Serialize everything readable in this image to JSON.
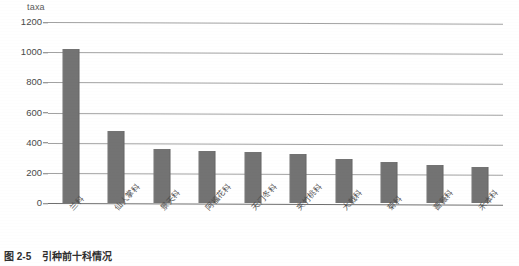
{
  "figure": {
    "caption_number": "图 2-5",
    "caption_text": "引种前十科情况"
  },
  "chart_data": {
    "type": "bar",
    "title": "引种前十科情况",
    "xlabel": "",
    "ylabel": "taxa",
    "ylim": [
      0,
      1200
    ],
    "yticks": [
      0,
      200,
      400,
      600,
      800,
      1000,
      1200
    ],
    "grid": true,
    "legend": "none",
    "bar_color": "#737373",
    "categories": [
      "兰科",
      "仙人掌科",
      "景天科",
      "阿福花科",
      "天门冬科",
      "夹竹桃科",
      "大戟科",
      "菊科",
      "蔷薇科",
      "禾本科"
    ],
    "values": [
      1020,
      480,
      360,
      345,
      335,
      325,
      295,
      275,
      255,
      240
    ]
  }
}
